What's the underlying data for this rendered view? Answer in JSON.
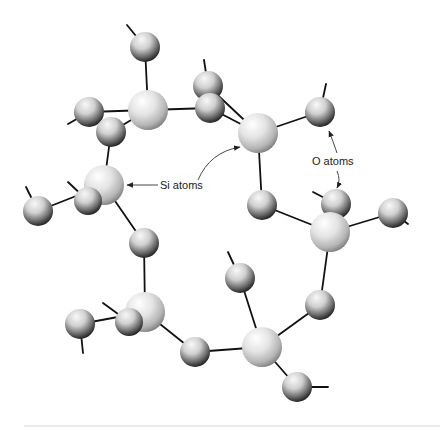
{
  "figure": {
    "type": "molecular-structure",
    "colors": {
      "background": "#ffffff",
      "bond": "#111111",
      "si_highlight": "#ffffff",
      "si_mid": "#d9d9d9",
      "si_shadow": "#8a8a8a",
      "o_highlight": "#f4f4f4",
      "o_mid": "#a8a8a8",
      "o_shadow": "#1a1a1a",
      "rule": "#d8d8d8"
    }
  },
  "labels": {
    "si": "Si atoms",
    "o": "O atoms"
  },
  "atoms": {
    "si": [
      {
        "id": "Si1",
        "x": 148,
        "y": 110,
        "r": 20
      },
      {
        "id": "Si2",
        "x": 258,
        "y": 133,
        "r": 20
      },
      {
        "id": "Si3",
        "x": 104,
        "y": 185,
        "r": 20
      },
      {
        "id": "Si4",
        "x": 330,
        "y": 232,
        "r": 20
      },
      {
        "id": "Si5",
        "x": 145,
        "y": 312,
        "r": 20
      },
      {
        "id": "Si6",
        "x": 262,
        "y": 347,
        "r": 20
      }
    ],
    "o": [
      {
        "id": "O1",
        "x": 145,
        "y": 47,
        "r": 15
      },
      {
        "id": "O2",
        "x": 89,
        "y": 112,
        "r": 15
      },
      {
        "id": "O3",
        "x": 111,
        "y": 132,
        "r": 15
      },
      {
        "id": "O4",
        "x": 208,
        "y": 86,
        "r": 15
      },
      {
        "id": "O5",
        "x": 210,
        "y": 108,
        "r": 15
      },
      {
        "id": "O6",
        "x": 320,
        "y": 112,
        "r": 15
      },
      {
        "id": "O7",
        "x": 38,
        "y": 211,
        "r": 15
      },
      {
        "id": "O8",
        "x": 88,
        "y": 201,
        "r": 14
      },
      {
        "id": "O9",
        "x": 144,
        "y": 243,
        "r": 15
      },
      {
        "id": "O10",
        "x": 262,
        "y": 205,
        "r": 15
      },
      {
        "id": "O11",
        "x": 336,
        "y": 204,
        "r": 15
      },
      {
        "id": "O12",
        "x": 393,
        "y": 213,
        "r": 15
      },
      {
        "id": "O13",
        "x": 80,
        "y": 324,
        "r": 15
      },
      {
        "id": "O14",
        "x": 129,
        "y": 322,
        "r": 14
      },
      {
        "id": "O15",
        "x": 240,
        "y": 278,
        "r": 15
      },
      {
        "id": "O16",
        "x": 320,
        "y": 305,
        "r": 15
      },
      {
        "id": "O17",
        "x": 195,
        "y": 352,
        "r": 15
      },
      {
        "id": "O18",
        "x": 297,
        "y": 387,
        "r": 15
      }
    ]
  },
  "bonds": [
    [
      148,
      110,
      145,
      47
    ],
    [
      148,
      110,
      89,
      112
    ],
    [
      148,
      110,
      111,
      132
    ],
    [
      148,
      110,
      210,
      108
    ],
    [
      111,
      132,
      104,
      185
    ],
    [
      258,
      133,
      208,
      86
    ],
    [
      258,
      133,
      210,
      108
    ],
    [
      258,
      133,
      320,
      112
    ],
    [
      258,
      133,
      262,
      205
    ],
    [
      104,
      185,
      38,
      211
    ],
    [
      104,
      185,
      88,
      201
    ],
    [
      104,
      185,
      144,
      243
    ],
    [
      262,
      205,
      330,
      232
    ],
    [
      330,
      232,
      336,
      204
    ],
    [
      330,
      232,
      393,
      213
    ],
    [
      330,
      232,
      320,
      305
    ],
    [
      144,
      243,
      145,
      312
    ],
    [
      145,
      312,
      80,
      324
    ],
    [
      145,
      312,
      129,
      322
    ],
    [
      145,
      312,
      195,
      352
    ],
    [
      195,
      352,
      262,
      347
    ],
    [
      262,
      347,
      240,
      278
    ],
    [
      262,
      347,
      320,
      305
    ],
    [
      262,
      347,
      297,
      387
    ]
  ],
  "stubs": [
    [
      145,
      47,
      127,
      25
    ],
    [
      208,
      86,
      204,
      60
    ],
    [
      320,
      112,
      326,
      84
    ],
    [
      89,
      112,
      68,
      124
    ],
    [
      38,
      211,
      26,
      187
    ],
    [
      88,
      201,
      68,
      182
    ],
    [
      336,
      204,
      313,
      192
    ],
    [
      393,
      213,
      408,
      224
    ],
    [
      80,
      324,
      83,
      353
    ],
    [
      129,
      322,
      103,
      303
    ],
    [
      240,
      278,
      228,
      252
    ],
    [
      297,
      387,
      328,
      387
    ]
  ]
}
